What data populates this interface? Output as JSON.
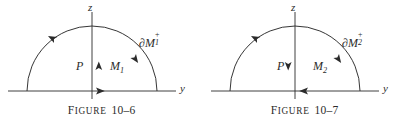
{
  "page": {
    "background_color": "#ffffff",
    "ink_color": "#2b2b2b",
    "width": 407,
    "height": 132
  },
  "figures": [
    {
      "id": "figure-10-6",
      "caption": {
        "lead": "F",
        "rest": "IGURE",
        "number": "10–6",
        "full": "FIGURE 10-6"
      },
      "axes": {
        "vertical_label": "z",
        "horizontal_label": "y"
      },
      "labels": {
        "point": "P",
        "region_base": "M",
        "region_index": "1",
        "region_full": "M₁",
        "boundary_base": "∂M",
        "boundary_sign": "+",
        "boundary_index": "1",
        "boundary_full": "∂M₁⁺"
      },
      "arrows": {
        "normal_direction": "up",
        "baseline_direction": "right",
        "arc_orientation": "counterclockwise"
      }
    },
    {
      "id": "figure-10-7",
      "caption": {
        "lead": "F",
        "rest": "IGURE",
        "number": "10–7",
        "full": "FIGURE 10-7"
      },
      "axes": {
        "vertical_label": "z",
        "horizontal_label": "y"
      },
      "labels": {
        "point": "P",
        "region_base": "M",
        "region_index": "2",
        "region_full": "M₂",
        "boundary_base": "∂M",
        "boundary_sign": "+",
        "boundary_index": "2",
        "boundary_full": "∂M₂⁺"
      },
      "arrows": {
        "normal_direction": "down",
        "baseline_direction": "left",
        "arc_orientation": "counterclockwise"
      }
    }
  ]
}
